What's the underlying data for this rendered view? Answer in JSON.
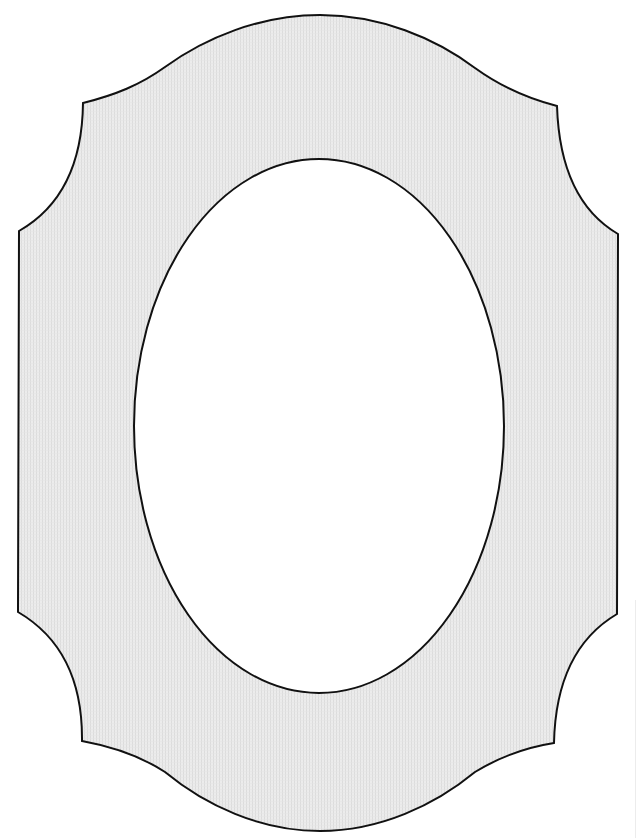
{
  "figure": {
    "title": "Ornamental picture frame outline with oval opening",
    "description": "Scalloped-corner frame with textured light gray mat and blank oval center",
    "canvas": {
      "width": 639,
      "height": 838
    },
    "colors": {
      "background": "#ffffff",
      "frame_fill": "#ececec",
      "texture_line": "#dcdcdc",
      "stroke": "#111111",
      "oval_fill": "#ffffff"
    },
    "outer_shape": {
      "type": "scalloped-frame",
      "top_peak": [
        320,
        15
      ],
      "bottom_peak": [
        320,
        831
      ],
      "corner_cusps": {
        "top_left": [
          [
            83,
            103
          ],
          [
            19,
            231
          ]
        ],
        "top_right": [
          [
            557,
            106
          ],
          [
            618,
            234
          ]
        ],
        "bottom_right": [
          [
            617,
            614
          ],
          [
            554,
            743
          ]
        ],
        "bottom_left": [
          [
            82,
            741
          ],
          [
            18,
            612
          ]
        ]
      },
      "stroke_width": 2
    },
    "inner_oval": {
      "cx": 319,
      "cy": 426,
      "rx": 185,
      "ry": 267,
      "fill": "#ffffff",
      "stroke_width": 2
    }
  }
}
